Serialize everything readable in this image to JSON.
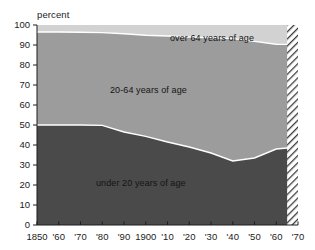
{
  "chart_data": {
    "type": "area",
    "title": "",
    "subtitle": "",
    "xlabel": "",
    "ylabel": "percent",
    "stacked": true,
    "grid": false,
    "legend_position": "inline-annotations",
    "xlim": [
      1850,
      1970
    ],
    "ylim": [
      0,
      100
    ],
    "x": [
      1850,
      1860,
      1870,
      1880,
      1890,
      1900,
      1910,
      1920,
      1930,
      1940,
      1950,
      1960,
      1965,
      1970
    ],
    "x_tick_labels": [
      "1850",
      "'60",
      "'70",
      "'80",
      "'90",
      "1900",
      "'10",
      "'20",
      "'30",
      "'40",
      "'50",
      "'60",
      "'70"
    ],
    "x_tick_values": [
      1850,
      1860,
      1870,
      1880,
      1890,
      1900,
      1910,
      1920,
      1930,
      1940,
      1950,
      1960,
      1970
    ],
    "y_tick_labels": [
      "100",
      "90",
      "80",
      "70",
      "60",
      "50",
      "40",
      "30",
      "20",
      "10",
      "0"
    ],
    "y_tick_values": [
      100,
      90,
      80,
      70,
      60,
      50,
      40,
      30,
      20,
      10,
      0
    ],
    "series": [
      {
        "name": "under 20 years of age",
        "label": "under 20 years of age",
        "color": "#4a4a4a",
        "values": [
          50.0,
          50.0,
          50.0,
          49.8,
          46.5,
          44.3,
          41.5,
          39.0,
          36.0,
          32.0,
          33.5,
          38.0,
          38.5,
          38.5
        ]
      },
      {
        "name": "20-64 years of age",
        "label": "20-64 years of age",
        "color": "#9c9c9c",
        "values": [
          46.5,
          46.5,
          46.4,
          46.4,
          49.1,
          50.6,
          53.0,
          55.0,
          57.6,
          61.2,
          58.3,
          52.4,
          51.8,
          51.8
        ]
      },
      {
        "name": "over 64 years of age",
        "label": "over 64 years of age",
        "color": "#d2d2d2",
        "values": [
          3.5,
          3.5,
          3.6,
          3.8,
          4.4,
          5.1,
          5.5,
          6.0,
          6.4,
          6.8,
          8.2,
          9.6,
          9.7,
          9.7
        ]
      }
    ],
    "projection": {
      "label": "",
      "start_year": 1965,
      "end_year": 1970,
      "style": "diagonal-hatch"
    },
    "colors": {
      "under20": "#4a4a4a",
      "age20to64": "#9c9c9c",
      "over64": "#d2d2d2",
      "separator": "#ffffff",
      "axis": "#1c1c1c",
      "background": "#ffffff"
    }
  },
  "axis": {
    "y_title": "percent"
  },
  "labels": {
    "over64": "over 64 years of age",
    "age20to64": "20-64 years of age",
    "under20": "under 20 years of age"
  },
  "yticks": [
    {
      "label": "100"
    },
    {
      "label": "90"
    },
    {
      "label": "80"
    },
    {
      "label": "70"
    },
    {
      "label": "60"
    },
    {
      "label": "50"
    },
    {
      "label": "40"
    },
    {
      "label": "30"
    },
    {
      "label": "20"
    },
    {
      "label": "10"
    },
    {
      "label": "0"
    }
  ],
  "xticks": [
    {
      "label": "1850"
    },
    {
      "label": "'60"
    },
    {
      "label": "'70"
    },
    {
      "label": "'80"
    },
    {
      "label": "'90"
    },
    {
      "label": "1900"
    },
    {
      "label": "'10"
    },
    {
      "label": "'20"
    },
    {
      "label": "'30"
    },
    {
      "label": "'40"
    },
    {
      "label": "'50"
    },
    {
      "label": "'60"
    },
    {
      "label": "'70"
    }
  ]
}
